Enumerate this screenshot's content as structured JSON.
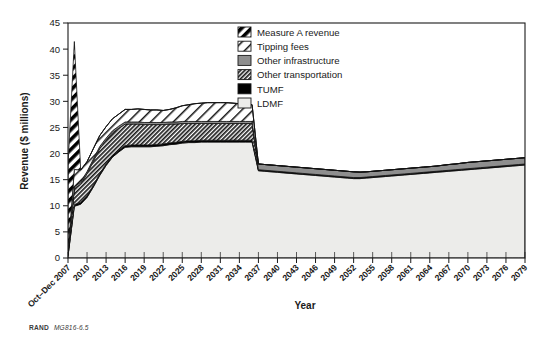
{
  "figure": {
    "source_note_bold": "RAND",
    "source_note_italic": "MG816-6.5",
    "width": 556,
    "height": 348
  },
  "legend": {
    "position": "top-right",
    "items": [
      {
        "label": "Measure A revenue",
        "swatch": "diagonal-hatch-bold-black",
        "color": "#000000"
      },
      {
        "label": "Tipping fees",
        "swatch": "diagonal-hatch-wide-white",
        "color": "#ffffff"
      },
      {
        "label": "Other infrastructure",
        "swatch": "solid-gray",
        "color": "#8e8e8e"
      },
      {
        "label": "Other transportation",
        "swatch": "diagonal-hatch-dense",
        "color": "#2b2b2b"
      },
      {
        "label": "TUMF",
        "swatch": "solid-black",
        "color": "#000000"
      },
      {
        "label": "LDMF",
        "swatch": "solid-light",
        "color": "#e9e9e6"
      }
    ]
  },
  "chart_data": {
    "type": "area",
    "stacked": true,
    "title": "",
    "xlabel": "Year",
    "ylabel": "Revenue ($ millions)",
    "ylim": [
      0,
      45
    ],
    "ytick_step": 5,
    "yticks": [
      0,
      5,
      10,
      15,
      20,
      25,
      30,
      35,
      40,
      45
    ],
    "grid": false,
    "legend_position": "top-right",
    "xtick_labels": [
      "Oct–Dec 2007",
      "2010",
      "2013",
      "2016",
      "2019",
      "2022",
      "2025",
      "2028",
      "2031",
      "2034",
      "2037",
      "2040",
      "2043",
      "2046",
      "2049",
      "2052",
      "2055",
      "2058",
      "2061",
      "2064",
      "2067",
      "2070",
      "2073",
      "2076",
      "2079"
    ],
    "x": [
      2007,
      2008,
      2009,
      2010,
      2011,
      2012,
      2013,
      2014,
      2015,
      2016,
      2017,
      2018,
      2019,
      2020,
      2021,
      2022,
      2023,
      2024,
      2025,
      2026,
      2027,
      2028,
      2029,
      2030,
      2031,
      2032,
      2033,
      2034,
      2035,
      2036,
      2037,
      2038,
      2039,
      2040,
      2041,
      2042,
      2043,
      2044,
      2045,
      2046,
      2047,
      2048,
      2049,
      2050,
      2051,
      2052,
      2053,
      2054,
      2055,
      2056,
      2057,
      2058,
      2059,
      2060,
      2061,
      2062,
      2063,
      2064,
      2065,
      2066,
      2067,
      2068,
      2069,
      2070,
      2071,
      2072,
      2073,
      2074,
      2075,
      2076,
      2077,
      2078,
      2079
    ],
    "series": [
      {
        "name": "LDMF",
        "values": [
          0.4,
          9.9,
          10.3,
          11.6,
          13.6,
          15.8,
          17.7,
          19.3,
          20.3,
          21.2,
          21.3,
          21.3,
          21.3,
          21.3,
          21.4,
          21.5,
          21.7,
          21.8,
          22.0,
          22.1,
          22.1,
          22.2,
          22.2,
          22.2,
          22.2,
          22.2,
          22.2,
          22.2,
          22.2,
          22.2,
          16.7,
          16.6,
          16.5,
          16.4,
          16.3,
          16.2,
          16.1,
          16.0,
          15.9,
          15.8,
          15.7,
          15.6,
          15.5,
          15.4,
          15.3,
          15.2,
          15.2,
          15.3,
          15.4,
          15.5,
          15.6,
          15.7,
          15.8,
          15.9,
          16.0,
          16.1,
          16.2,
          16.3,
          16.4,
          16.5,
          16.6,
          16.7,
          16.8,
          16.9,
          17.0,
          17.1,
          17.2,
          17.3,
          17.4,
          17.5,
          17.6,
          17.7,
          17.8
        ]
      },
      {
        "name": "TUMF",
        "values": [
          0.1,
          0.35,
          0.35,
          0.35,
          0.35,
          0.35,
          0.35,
          0.35,
          0.35,
          0.35,
          0.35,
          0.35,
          0.35,
          0.35,
          0.35,
          0.35,
          0.35,
          0.35,
          0.35,
          0.35,
          0.35,
          0.35,
          0.35,
          0.35,
          0.35,
          0.35,
          0.35,
          0.35,
          0.35,
          0.35,
          0.2,
          0.2,
          0.2,
          0.2,
          0.2,
          0.2,
          0.2,
          0.2,
          0.2,
          0.2,
          0.2,
          0.2,
          0.2,
          0.2,
          0.2,
          0.2,
          0.2,
          0.2,
          0.2,
          0.2,
          0.2,
          0.2,
          0.2,
          0.2,
          0.2,
          0.2,
          0.2,
          0.2,
          0.2,
          0.2,
          0.2,
          0.2,
          0.2,
          0.2,
          0.2,
          0.2,
          0.2,
          0.2,
          0.2,
          0.2,
          0.2,
          0.2,
          0.2
        ]
      },
      {
        "name": "Other transportation",
        "values": [
          0.3,
          3.0,
          3.5,
          4.2,
          4.6,
          4.8,
          4.5,
          4.3,
          4.2,
          4.1,
          4.0,
          4.0,
          3.9,
          3.9,
          3.8,
          3.7,
          3.6,
          3.5,
          3.4,
          3.3,
          3.3,
          3.2,
          3.2,
          3.2,
          3.2,
          3.2,
          3.2,
          3.2,
          3.2,
          3.2,
          0.0,
          0.0,
          0.0,
          0.0,
          0.0,
          0.0,
          0.0,
          0.0,
          0.0,
          0.0,
          0.0,
          0.0,
          0.0,
          0.0,
          0.0,
          0.0,
          0.0,
          0.0,
          0.0,
          0.0,
          0.0,
          0.0,
          0.0,
          0.0,
          0.0,
          0.0,
          0.0,
          0.0,
          0.0,
          0.0,
          0.0,
          0.0,
          0.0,
          0.0,
          0.0,
          0.0,
          0.0,
          0.0,
          0.0,
          0.0,
          0.0,
          0.0,
          0.0
        ]
      },
      {
        "name": "Other infrastructure",
        "values": [
          0.1,
          0.4,
          0.4,
          0.4,
          0.4,
          0.4,
          0.4,
          0.4,
          0.4,
          0.4,
          0.4,
          0.4,
          0.4,
          0.4,
          0.4,
          0.4,
          0.4,
          0.4,
          0.4,
          0.4,
          0.4,
          0.4,
          0.4,
          0.4,
          0.4,
          0.4,
          0.4,
          0.4,
          0.4,
          0.4,
          1.1,
          1.1,
          1.1,
          1.1,
          1.1,
          1.1,
          1.1,
          1.1,
          1.1,
          1.1,
          1.1,
          1.1,
          1.1,
          1.1,
          1.1,
          1.1,
          1.05,
          1.0,
          1.0,
          1.0,
          1.0,
          1.0,
          1.0,
          1.0,
          1.0,
          1.0,
          1.0,
          1.0,
          1.0,
          1.05,
          1.1,
          1.1,
          1.15,
          1.2,
          1.2,
          1.2,
          1.2,
          1.2,
          1.2,
          1.2,
          1.2,
          1.2,
          1.2
        ]
      },
      {
        "name": "Tipping fees",
        "values": [
          0.2,
          3.3,
          2.3,
          1.9,
          2.0,
          2.1,
          2.2,
          2.3,
          2.3,
          2.4,
          2.4,
          2.5,
          2.5,
          2.4,
          2.4,
          2.3,
          2.4,
          2.7,
          3.0,
          3.2,
          3.4,
          3.5,
          3.6,
          3.6,
          3.6,
          3.6,
          3.5,
          3.4,
          3.3,
          3.2,
          0.0,
          0.0,
          0.0,
          0.0,
          0.0,
          0.0,
          0.0,
          0.0,
          0.0,
          0.0,
          0.0,
          0.0,
          0.0,
          0.0,
          0.0,
          0.0,
          0.0,
          0.0,
          0.0,
          0.0,
          0.0,
          0.0,
          0.0,
          0.0,
          0.0,
          0.0,
          0.0,
          0.0,
          0.0,
          0.0,
          0.0,
          0.0,
          0.0,
          0.0,
          0.0,
          0.0,
          0.0,
          0.0,
          0.0,
          0.0,
          0.0,
          0.0,
          0.0
        ]
      },
      {
        "name": "Measure A revenue",
        "values": [
          16.8,
          24.5,
          0,
          0,
          0,
          0,
          0,
          0,
          0,
          0,
          0,
          0,
          0,
          0,
          0,
          0,
          0,
          0,
          0,
          0,
          0,
          0,
          0,
          0,
          0,
          0,
          0,
          0,
          0,
          0,
          0,
          0,
          0,
          0,
          0,
          0,
          0,
          0,
          0,
          0,
          0,
          0,
          0,
          0,
          0,
          0,
          0,
          0,
          0,
          0,
          0,
          0,
          0,
          0,
          0,
          0,
          0,
          0,
          0,
          0,
          0,
          0,
          0,
          0,
          0,
          0,
          0,
          0,
          0,
          0,
          0,
          0,
          0
        ]
      }
    ],
    "notes": {
      "spike": "Measure A revenue spike of ~41 at 2008-2009, absent thereafter",
      "drop": "Sharp drop in total revenue at 2037 from ~27 to ~18"
    }
  }
}
